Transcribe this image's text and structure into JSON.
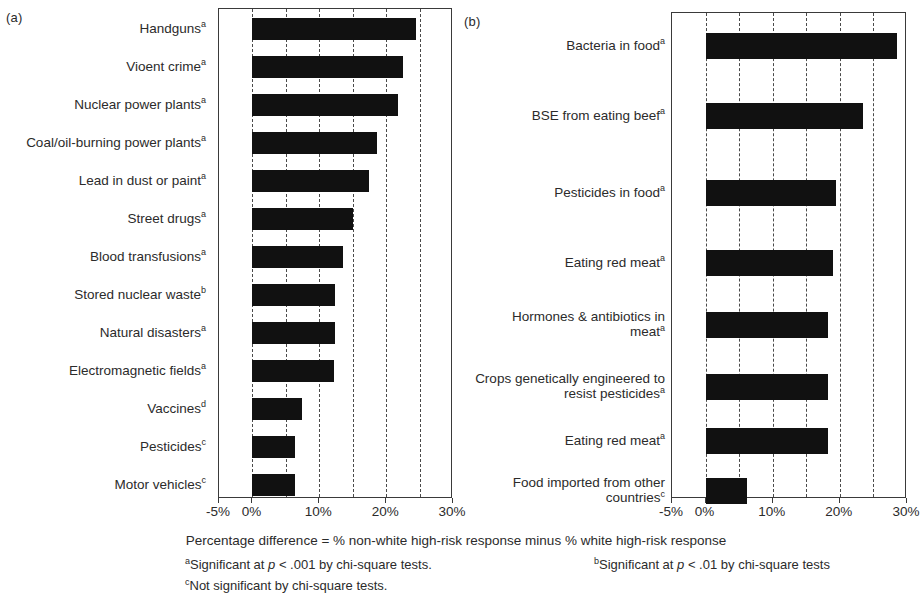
{
  "figure": {
    "caption": "Percentage difference = % non-white high-risk response minus % white high-risk response",
    "footnotes": [
      {
        "marker": "a",
        "text": "Significant at ",
        "italic": "p",
        "rest": " < .001 by chi-square tests."
      },
      {
        "marker": "b",
        "text": "Significant at ",
        "italic": "p",
        "rest": " < .01 by chi-square tests"
      },
      {
        "marker": "c",
        "text": "Not significant by chi-square tests.",
        "italic": "",
        "rest": ""
      }
    ]
  },
  "panel_a": {
    "letter": "(a)",
    "tick_labels": [
      "-5%",
      "0%",
      "10%",
      "20%",
      "30%"
    ]
  },
  "panel_b": {
    "letter": "(b)",
    "tick_labels": [
      "-5%",
      "0%",
      "10%",
      "20%",
      "30%"
    ]
  },
  "chart_data": [
    {
      "type": "bar",
      "orientation": "horizontal",
      "panel": "(a)",
      "title": "",
      "xlabel": "Percentage difference = % non-white high-risk response minus % white high-risk response",
      "ylabel": "",
      "xlim": [
        -5,
        30
      ],
      "xticks": [
        -5,
        0,
        10,
        20,
        30
      ],
      "xtick_labels": [
        "-5%",
        "0%",
        "10%",
        "20%",
        "30%"
      ],
      "gridlines": [
        0,
        5,
        10,
        15,
        20,
        25
      ],
      "grid": true,
      "legend": "none",
      "bar_color": "#111111",
      "categories": [
        "Handguns",
        "Vioent crime",
        "Nuclear power plants",
        "Coal/oil-burning power plants",
        "Lead in dust or paint",
        "Street drugs",
        "Blood transfusions",
        "Stored nuclear waste",
        "Natural disasters",
        "Electromagnetic fields",
        "Vaccines",
        "Pesticides",
        "Motor vehicles"
      ],
      "category_markers": [
        "a",
        "a",
        "a",
        "a",
        "a",
        "a",
        "a",
        "b",
        "a",
        "a",
        "d",
        "c",
        "c"
      ],
      "values": [
        24.5,
        22.5,
        21.8,
        18.6,
        17.5,
        15.1,
        13.5,
        12.3,
        12.4,
        12.2,
        7.4,
        6.4,
        6.3
      ]
    },
    {
      "type": "bar",
      "orientation": "horizontal",
      "panel": "(b)",
      "title": "",
      "xlabel": "Percentage difference = % non-white high-risk response minus % white high-risk response",
      "ylabel": "",
      "xlim": [
        -5,
        30
      ],
      "xticks": [
        -5,
        0,
        10,
        20,
        30
      ],
      "xtick_labels": [
        "-5%",
        "0%",
        "10%",
        "20%",
        "30%"
      ],
      "gridlines": [
        0,
        5,
        10,
        15,
        20,
        25
      ],
      "grid": true,
      "legend": "none",
      "bar_color": "#111111",
      "categories": [
        "Bacteria in food",
        "BSE from eating beef",
        "Pesticides in food",
        "Eating red meat",
        "Hormones & antibiotics in meat",
        "Crops genetically engineered to resist pesticides",
        "Eating red meat",
        "Food imported from other countries"
      ],
      "category_markers": [
        "a",
        "a",
        "a",
        "a",
        "a",
        "a",
        "a",
        "c"
      ],
      "values": [
        28.5,
        23.5,
        19.5,
        19.0,
        18.3,
        18.3,
        18.3,
        6.2
      ]
    }
  ]
}
